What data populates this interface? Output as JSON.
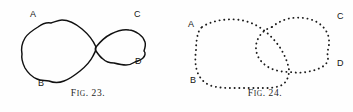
{
  "plate": {
    "name": "two-figure-plate",
    "background_color": "#fefefe",
    "ink_color": "#111111"
  },
  "figures": [
    {
      "id": "fig-23",
      "caption_prefix": "F",
      "caption_small": "IG",
      "caption_number": ". 23.",
      "caption_full": "FIG. 23.",
      "style": "solid-outline",
      "description": "Two irregular closed curves drawn with continuous ink outlines, meeting at a single tangent point near the middle.",
      "labels": [
        {
          "text": "A",
          "x": 30,
          "y": 10,
          "corner": "top-left"
        },
        {
          "text": "B",
          "x": 38,
          "y": 79,
          "corner": "bottom-left"
        },
        {
          "text": "C",
          "x": 134,
          "y": 10,
          "corner": "top-right"
        },
        {
          "text": "D",
          "x": 135,
          "y": 57,
          "corner": "bottom-right"
        }
      ],
      "shapes": [
        {
          "name": "left-blob",
          "path": "M 96 47 C 93 40 88 34 82 29 C 76 24 70 20 62 20 C 58 20 55 22 51 23 C 46 22 42 24 38 27 C 33 30 28 33 25 38 C 22 43 21 49 22 54 C 21 59 23 64 25 68 C 28 73 32 77 37 79 C 41 81 45 80 49 81 C 54 83 59 83 64 81 C 70 79 75 75 80 71 C 85 67 90 62 93 56 C 95 53 96 50 96 47 Z"
        },
        {
          "name": "right-blob",
          "path": "M 96 47 C 100 42 105 37 111 34 C 117 31 123 29 129 30 C 133 30 136 32 139 34 C 142 36 144 39 145 42 C 146 45 145 48 144 51 C 146 53 145 56 143 58 C 141 60 138 61 135 62 C 132 64 129 65 126 65 C 122 65 118 64 114 63 C 110 63 106 62 103 59 C 100 57 98 54 96 51 C 95 49 95 48 96 47 Z"
        }
      ]
    },
    {
      "id": "fig-24",
      "caption_prefix": "F",
      "caption_small": "IG",
      "caption_number": ". 24.",
      "caption_full": "FIG. 24.",
      "style": "dotted-outline",
      "description": "Two irregular closed curves rendered as rows of small dots; the curves cross and overlap near the middle.",
      "labels": [
        {
          "text": "A",
          "x": 11,
          "y": 20,
          "corner": "top-left"
        },
        {
          "text": "B",
          "x": 13,
          "y": 76,
          "corner": "bottom-left"
        },
        {
          "text": "C",
          "x": 160,
          "y": 12,
          "corner": "top-right"
        },
        {
          "text": "D",
          "x": 160,
          "y": 59,
          "corner": "bottom-right"
        }
      ],
      "shapes": [
        {
          "name": "left-blob",
          "path": "M 25 27 C 31 23 38 21 45 20 C 53 19 61 19 68 21 C 76 23 83 27 89 32 C 95 37 100 43 104 49 C 108 56 111 63 112 70 C 112 76 110 82 105 85 C 99 88 92 88 85 88 C 76 88 67 88 58 88 C 49 88 40 88 32 85 C 26 82 22 77 20 71 C 18 64 18 57 19 50 C 19 43 20 36 22 31 C 23 29 24 28 25 27 Z"
        },
        {
          "name": "right-blob",
          "path": "M 95 27 C 101 22 108 19 115 18 C 123 17 131 18 138 21 C 144 24 149 29 151 35 C 153 41 152 47 150 53 C 152 57 151 62 148 65 C 144 68 139 70 134 71 C 127 73 120 73 113 72 C 106 72 99 71 93 68 C 87 65 82 60 80 54 C 78 48 79 42 82 37 C 85 32 89 29 95 27 Z"
        }
      ]
    }
  ]
}
